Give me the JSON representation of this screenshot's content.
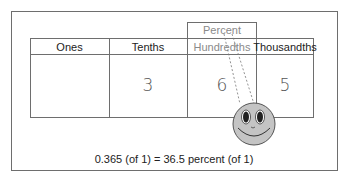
{
  "diagram": {
    "percent_label": "Percent",
    "columns": [
      {
        "header": "Ones",
        "value": ""
      },
      {
        "header": "Tenths",
        "value": "3"
      },
      {
        "header": "Hundredths",
        "value": "6"
      },
      {
        "header": "Thousandths",
        "value": "5"
      }
    ],
    "caption": "0.365 (of 1) = 36.5 percent (of 1)",
    "mascot": "smiley-face-icon",
    "colors": {
      "face_fill": "#c4c4c4",
      "border": "#6e6e6e",
      "percent_text": "#8a8a8a"
    }
  }
}
